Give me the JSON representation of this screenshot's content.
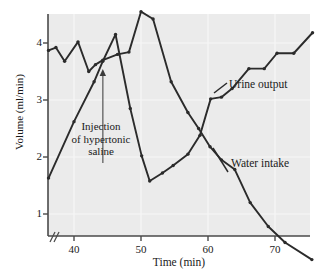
{
  "chart_data": {
    "type": "line",
    "title": "",
    "xlabel": "Time (min)",
    "ylabel": "Volume (ml/min)",
    "xlim": [
      36,
      76
    ],
    "ylim": [
      0,
      4.7
    ],
    "xticks": [
      40,
      50,
      60,
      70
    ],
    "yticks": [
      1,
      2,
      3,
      4
    ],
    "xtick_labels": [
      "40",
      "50",
      "60",
      "70"
    ],
    "ytick_labels": [
      "1",
      "2",
      "3",
      "4"
    ],
    "grid": true,
    "axis_break": "//",
    "legend_position": "inline-labels",
    "series": [
      {
        "name": "Urine output",
        "label": "Urine output",
        "color": "#2b2b2b",
        "points": [
          {
            "x": 36.2,
            "y": 3.87
          },
          {
            "x": 37.3,
            "y": 3.92
          },
          {
            "x": 38.6,
            "y": 3.68
          },
          {
            "x": 40.6,
            "y": 4.02
          },
          {
            "x": 42.2,
            "y": 3.5
          },
          {
            "x": 43.2,
            "y": 3.62
          },
          {
            "x": 44.3,
            "y": 3.7
          },
          {
            "x": 46.5,
            "y": 3.8
          },
          {
            "x": 48.2,
            "y": 3.84
          },
          {
            "x": 50.0,
            "y": 4.55
          },
          {
            "x": 51.8,
            "y": 4.42
          },
          {
            "x": 54.5,
            "y": 3.32
          },
          {
            "x": 57.0,
            "y": 2.78
          },
          {
            "x": 58.6,
            "y": 2.5
          },
          {
            "x": 60.3,
            "y": 2.18
          },
          {
            "x": 62.0,
            "y": 1.95
          },
          {
            "x": 64.0,
            "y": 1.78
          },
          {
            "x": 66.3,
            "y": 1.2
          },
          {
            "x": 69.0,
            "y": 0.78
          },
          {
            "x": 71.5,
            "y": 0.5
          },
          {
            "x": 75.5,
            "y": 0.2
          }
        ]
      },
      {
        "name": "Water intake",
        "label": "Water intake",
        "color": "#2b2b2b",
        "points": [
          {
            "x": 36.2,
            "y": 1.63
          },
          {
            "x": 40.0,
            "y": 2.62
          },
          {
            "x": 43.0,
            "y": 3.32
          },
          {
            "x": 44.3,
            "y": 3.68
          },
          {
            "x": 46.2,
            "y": 4.15
          },
          {
            "x": 48.4,
            "y": 2.85
          },
          {
            "x": 50.1,
            "y": 2.02
          },
          {
            "x": 51.3,
            "y": 1.58
          },
          {
            "x": 53.2,
            "y": 1.72
          },
          {
            "x": 54.8,
            "y": 1.85
          },
          {
            "x": 57.0,
            "y": 2.05
          },
          {
            "x": 58.8,
            "y": 2.38
          },
          {
            "x": 60.4,
            "y": 3.02
          },
          {
            "x": 62.0,
            "y": 3.05
          },
          {
            "x": 63.6,
            "y": 3.2
          },
          {
            "x": 66.1,
            "y": 3.55
          },
          {
            "x": 68.4,
            "y": 3.55
          },
          {
            "x": 70.3,
            "y": 3.82
          },
          {
            "x": 72.8,
            "y": 3.82
          },
          {
            "x": 75.6,
            "y": 4.18
          }
        ]
      }
    ],
    "annotations": [
      {
        "name": "injection-marker",
        "text_lines": [
          "Injection",
          "of hypertonic",
          "saline"
        ],
        "arrow_x": 44.3,
        "arrow_tip_y": 3.58,
        "arrow_base_y": 2.7,
        "color": "#7a7a7a"
      }
    ]
  },
  "axis": {
    "x_title": "Time (min)",
    "y_title": "Volume (ml/min)",
    "break_symbol": "//"
  },
  "ticks": {
    "x": [
      "40",
      "50",
      "60",
      "70"
    ],
    "y": [
      "4",
      "3",
      "2",
      "1"
    ]
  },
  "labels": {
    "urine": "Urine output",
    "water": "Water intake"
  },
  "annotation": {
    "line1": "Injection",
    "line2": "of hypertonic",
    "line3": "saline"
  },
  "colors": {
    "plot_background": "#ebebeb",
    "gridline": "#f7f7f7",
    "line": "#2b2b2b",
    "axis": "#4a4a4a",
    "arrow": "#7a7a7a",
    "text": "#1a1a1a"
  }
}
